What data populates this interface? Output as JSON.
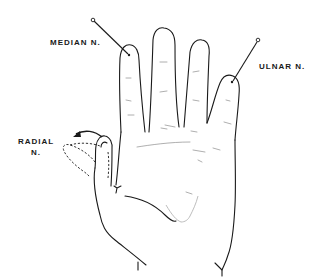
{
  "diagram": {
    "labels": {
      "median": "MEDIAN N.",
      "ulnar": "ULNAR N.",
      "radial_line1": "RADIAL",
      "radial_line2": "N."
    },
    "colors": {
      "ink": "#1a1a1a",
      "crease": "#9a9a9a",
      "background": "#ffffff"
    },
    "pins": [
      {
        "name": "median-pin",
        "head": [
          93,
          20
        ],
        "tip": [
          128,
          54
        ]
      },
      {
        "name": "ulnar-pin",
        "head": [
          258,
          40
        ],
        "tip": [
          233,
          81
        ]
      }
    ]
  }
}
